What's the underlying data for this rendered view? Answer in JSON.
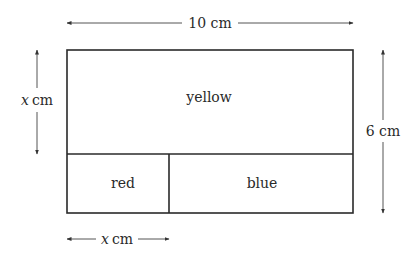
{
  "diagram": {
    "type": "rectangle-partition",
    "outer": {
      "width_label": "10 cm",
      "height_label": "6 cm"
    },
    "regions": {
      "top": {
        "label": "yellow"
      },
      "bottom_left": {
        "label": "red"
      },
      "bottom_right": {
        "label": "blue"
      }
    },
    "dimensions": {
      "top_width": {
        "value": "10",
        "unit": "cm"
      },
      "right_height": {
        "value": "6",
        "unit": "cm"
      },
      "left_height": {
        "var": "x",
        "unit": "cm"
      },
      "bottom_width": {
        "var": "x",
        "unit": "cm"
      }
    },
    "colors": {
      "line": "#2a2a2a",
      "arrow": "#555555",
      "background": "#ffffff"
    }
  }
}
